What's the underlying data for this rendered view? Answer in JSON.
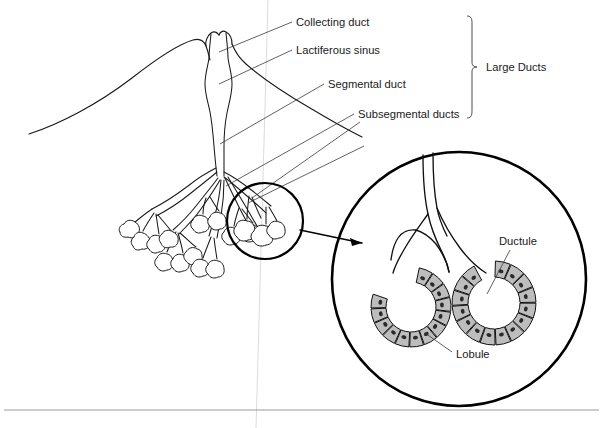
{
  "figure": {
    "width": 603,
    "height": 428,
    "background": "#ffffff"
  },
  "labels": {
    "collecting_duct": "Collecting duct",
    "lactiferous_sinus": "Lactiferous sinus",
    "segmental_duct": "Segmental duct",
    "subsegmental_ducts": "Subsegmental ducts",
    "large_ducts": "Large Ducts",
    "ductule": "Ductule",
    "lobule": "Lobule"
  },
  "colors": {
    "ink": "#1a1a1a",
    "leader": "#3a3a3a",
    "cell_fill": "#bdbdbd",
    "nucleus": "#2a2a2a",
    "rule": "#9a9a9a",
    "faint_line": "#dcdcdc",
    "background": "#ffffff"
  },
  "callouts": [
    {
      "name": "collecting-duct",
      "label": "Collecting duct",
      "text_x": 296,
      "text_y": 26
    },
    {
      "name": "lactiferous-sinus",
      "label": "Lactiferous sinus",
      "text_x": 296,
      "text_y": 54
    },
    {
      "name": "segmental-duct",
      "label": "Segmental duct",
      "text_x": 328,
      "text_y": 88
    },
    {
      "name": "subsegmental-ducts",
      "label": "Subsegmental ducts",
      "text_x": 358,
      "text_y": 118
    },
    {
      "name": "large-ducts",
      "label": "Large Ducts",
      "text_x": 486,
      "text_y": 71
    },
    {
      "name": "ductule",
      "label": "Ductule",
      "text_x": 499,
      "text_y": 245
    },
    {
      "name": "lobule",
      "label": "Lobule",
      "text_x": 456,
      "text_y": 358
    }
  ],
  "bracket": {
    "name": "large-ducts-bracket",
    "x": 472,
    "y_top": 16,
    "y_bottom": 118,
    "tick_y": 67
  },
  "magnifier": {
    "small_circle": {
      "cx": 265,
      "cy": 221,
      "r": 38
    },
    "big_circle": {
      "cx": 459,
      "cy": 279,
      "r": 127
    },
    "arrow_from_x": 306,
    "arrow_from_y": 233,
    "arrow_to_x": 363,
    "arrow_to_y": 244
  },
  "acini": [
    {
      "name": "left-acinus",
      "cx": 411,
      "cy": 307,
      "r_outer": 40,
      "r_inner": 25,
      "cells": 13,
      "start_deg": -78,
      "end_deg": 200
    },
    {
      "name": "right-acinus",
      "cx": 494,
      "cy": 303,
      "r_outer": 42,
      "r_inner": 26,
      "cells": 15,
      "start_deg": -88,
      "end_deg": 243
    }
  ],
  "footer_rule": {
    "y": 410,
    "x1": 4,
    "x2": 599
  },
  "faint_vertical": {
    "x_top": 268,
    "x_bottom": 256,
    "y1": 0,
    "y2": 428
  }
}
